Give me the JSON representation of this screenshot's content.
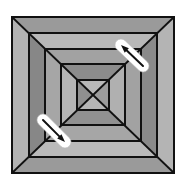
{
  "diagram": {
    "center": [
      93,
      95
    ],
    "squares": [
      {
        "x1": 12,
        "y1": 17,
        "x2": 174,
        "y2": 173
      },
      {
        "x1": 29,
        "y1": 33,
        "x2": 157,
        "y2": 157
      },
      {
        "x1": 45,
        "y1": 49,
        "x2": 141,
        "y2": 141
      },
      {
        "x1": 61,
        "y1": 64,
        "x2": 125,
        "y2": 125
      },
      {
        "x1": 77,
        "y1": 80,
        "x2": 109,
        "y2": 110
      }
    ],
    "ring_fills": [
      {
        "top": "#9a9a9a",
        "left": "#b2b2b2",
        "right": "#b4b4b4",
        "bottom": "#9a9a9a"
      },
      {
        "top": "#b8b8b8",
        "left": "#878787",
        "right": "#8a8a8a",
        "bottom": "#bababa"
      },
      {
        "top": "#a2a2a2",
        "left": "#a6a6a6",
        "right": "#a2a2a2",
        "bottom": "#a6a6a6"
      },
      {
        "top": "#8c8c8c",
        "left": "#b5b5b5",
        "right": "#b0b0b0",
        "bottom": "#919191"
      },
      {
        "top": "#b8b8b8",
        "left": "#909090",
        "right": "#9c9c9c",
        "bottom": "#b6b6b6"
      }
    ],
    "arrows": [
      {
        "name": "arrow-up-left",
        "tail": [
          143,
          66
        ],
        "head": [
          121,
          45
        ],
        "capsule_from": [
          121,
          45
        ],
        "capsule_to": [
          143,
          66
        ]
      },
      {
        "name": "arrow-down-right",
        "tail": [
          43,
          120
        ],
        "head": [
          65,
          142
        ],
        "capsule_from": [
          43,
          120
        ],
        "capsule_to": [
          65,
          142
        ]
      }
    ],
    "colors": {
      "line": "#111111",
      "background": "#ffffff",
      "capsule": "#ffffff"
    }
  }
}
